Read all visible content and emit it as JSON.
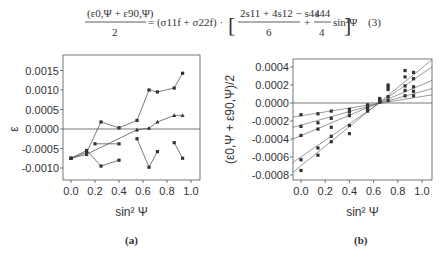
{
  "equation": {
    "lhs_numerator": "(ε0,Ψ + ε90,Ψ)",
    "lhs_denominator": "2",
    "middle": "= (σ11f + σ22f) ·",
    "frac1_numerator": "2s11 + 4s12 − s44",
    "frac1_denominator": "6",
    "plus": "+",
    "frac2_numerator": "s44",
    "frac2_denominator": "4",
    "trailing": "sin²Ψ",
    "number": "(3)"
  },
  "captions": {
    "a": "(a)",
    "b": "(b)"
  },
  "chart_data": [
    {
      "type": "line",
      "panel": "(a)",
      "title": "",
      "xlabel": "sin² Ψ",
      "ylabel": "ε",
      "xlim": [
        -0.05,
        1.07
      ],
      "ylim": [
        -0.0012,
        0.0018
      ],
      "x_ticks": [
        "0.0",
        "0.2",
        "0.4",
        "0.6",
        "0.8",
        "1.0"
      ],
      "y_ticks": [
        "0.0015",
        "0.0010",
        "0.0005",
        "0.0000",
        "-0.0005",
        "-0.0010"
      ],
      "grid": false,
      "zero_line": true,
      "series": [
        {
          "name": "s1",
          "marker": "square",
          "x": [
            0.0,
            0.13,
            0.25,
            0.4,
            0.55,
            0.65,
            0.72,
            0.86,
            0.93
          ],
          "y": [
            -0.00075,
            -0.0006,
            0.00018,
            3e-05,
            0.00022,
            0.001,
            0.00095,
            0.00105,
            0.00143
          ]
        },
        {
          "name": "s2",
          "marker": "triangle",
          "x": [
            0.0,
            0.13,
            0.55,
            0.65,
            0.72,
            0.86,
            0.93
          ],
          "y": [
            -0.00075,
            -0.00065,
            -2e-05,
            2e-05,
            0.00018,
            0.00035,
            0.00035
          ]
        },
        {
          "name": "s3",
          "marker": "square",
          "x": [
            0.2,
            0.4
          ],
          "y": [
            -0.00038,
            -0.00038
          ]
        },
        {
          "name": "s4",
          "marker": "square",
          "x": [
            0.0,
            0.13,
            0.25,
            0.4
          ],
          "y": [
            -0.00075,
            -0.00055,
            -0.00095,
            -0.0008
          ]
        },
        {
          "name": "s5",
          "marker": "square",
          "x": [
            0.55,
            0.65,
            0.72
          ],
          "y": [
            -0.00025,
            -0.00098,
            -0.00058
          ]
        },
        {
          "name": "s6",
          "marker": "square",
          "x": [
            0.86,
            0.93
          ],
          "y": [
            -0.00035,
            -0.00075
          ]
        }
      ]
    },
    {
      "type": "scatter",
      "panel": "(b)",
      "title": "",
      "xlabel": "sin² Ψ",
      "ylabel": "(ε0,Ψ + ε90,Ψ)/2",
      "xlim": [
        -0.066,
        1.08
      ],
      "ylim": [
        -0.00085,
        0.0005
      ],
      "x_ticks": [
        "0.0",
        "0.2",
        "0.4",
        "0.6",
        "0.8",
        "1.0"
      ],
      "y_ticks": [
        "0.0004",
        "0.0002",
        "0.0000",
        "-0.0002",
        "-0.0004",
        "-0.0006",
        "-0.0008"
      ],
      "grid": false,
      "zero_line": true,
      "fit_lines": [
        {
          "name": "l1",
          "y_at_left": -0.000156,
          "y_at_right": 9e-05
        },
        {
          "name": "l2",
          "y_at_left": -0.00027,
          "y_at_right": 0.00016
        },
        {
          "name": "l3",
          "y_at_left": -0.0004,
          "y_at_right": 0.00025
        },
        {
          "name": "l4",
          "y_at_left": -0.00066,
          "y_at_right": 0.0004
        },
        {
          "name": "l5",
          "y_at_left": -0.00077,
          "y_at_right": 0.00048
        }
      ],
      "x_points": [
        0.0,
        0.14,
        0.25,
        0.4,
        0.55,
        0.65,
        0.72,
        0.86,
        0.93
      ],
      "series": [
        {
          "name": "p1",
          "y": [
            -0.00013,
            -0.00012,
            -9e-05,
            -7e-05,
            -2e-05,
            1e-05,
            3e-05,
            8e-05,
            8e-05
          ]
        },
        {
          "name": "p2",
          "y": [
            -0.00026,
            -0.00022,
            -0.00017,
            -0.0001,
            -3e-05,
            2e-05,
            7e-05,
            0.00014,
            0.00013
          ]
        },
        {
          "name": "p3",
          "y": [
            -0.00036,
            -0.00029,
            -0.00027,
            -0.00014,
            -5e-05,
            3e-05,
            0.00015,
            0.00019,
            0.00018
          ]
        },
        {
          "name": "p4",
          "y": [
            -0.00063,
            -0.0005,
            -0.00037,
            -0.00025,
            -7e-05,
            4e-05,
            0.00018,
            0.00029,
            0.00027
          ]
        },
        {
          "name": "p5",
          "y": [
            -0.00075,
            -0.00058,
            -0.00043,
            -0.00034,
            -9e-05,
            5e-05,
            0.0002,
            0.00036,
            0.00034
          ]
        }
      ]
    }
  ]
}
